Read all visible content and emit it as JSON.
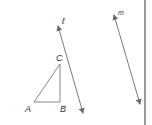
{
  "diagram": {
    "labels": {
      "line_l": "ℓ",
      "line_m": "m",
      "point_a": "A",
      "point_b": "B",
      "point_c": "C"
    },
    "colors": {
      "stroke": "#6b6b6b",
      "text": "#333333",
      "border": "#555555"
    },
    "triangle": {
      "A": [
        34,
        102
      ],
      "B": [
        60,
        102
      ],
      "C": [
        60,
        64
      ]
    },
    "line_l": {
      "from": [
        58,
        26
      ],
      "to": [
        83,
        113
      ]
    },
    "line_m": {
      "from": [
        114,
        15
      ],
      "to": [
        140,
        104
      ]
    }
  }
}
